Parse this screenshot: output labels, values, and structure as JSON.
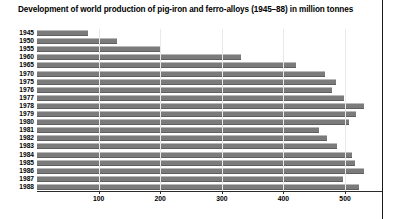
{
  "chart_data": {
    "type": "bar",
    "orientation": "horizontal",
    "title": "Development of world production of pig-iron and ferro-alloys (1945–88) in million tonnes",
    "xlabel": "",
    "ylabel": "",
    "unit": "million tonnes",
    "grid": false,
    "legend": "none",
    "xlim": [
      0,
      560
    ],
    "xticks": [
      100,
      200,
      300,
      400,
      500
    ],
    "xtick_labels": [
      "100",
      "200",
      "300",
      "400",
      "500"
    ],
    "categories": [
      "1945",
      "1950",
      "1955",
      "1960",
      "1965",
      "1970",
      "1975",
      "1976",
      "1977",
      "1978",
      "1979",
      "1980",
      "1981",
      "1982",
      "1983",
      "1984",
      "1985",
      "1986",
      "1987",
      "1988"
    ],
    "values": [
      83,
      130,
      201,
      331,
      421,
      468,
      485,
      479,
      499,
      531,
      517,
      506,
      457,
      471,
      487,
      511,
      516,
      530,
      496,
      523
    ],
    "series": [
      {
        "name": "World production of pig-iron and ferro-alloys",
        "values": [
          83,
          130,
          201,
          331,
          421,
          468,
          485,
          479,
          499,
          531,
          517,
          506,
          457,
          471,
          487,
          511,
          516,
          530,
          496,
          523
        ]
      }
    ]
  },
  "colors": {
    "bar_fill": "#7b7b7b",
    "bar_highlight": "#b9b9b9",
    "bar_shadow": "#5f5f5f",
    "axis": "#2b2b2b",
    "text": "#000000",
    "background": "#ffffff",
    "rule": "#1a1a1a"
  }
}
